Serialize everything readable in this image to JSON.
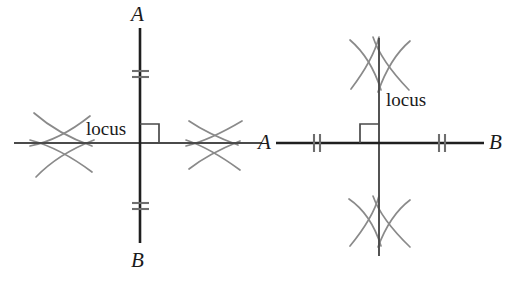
{
  "figure": {
    "kind": "geometry-construction-diagram",
    "stroke_color": "#2b2b2b",
    "arc_color": "#8a8a8a",
    "tick_color": "#6e6e6e",
    "background_color": "#ffffff",
    "panels": [
      {
        "id": "left-panel",
        "name": "vertical-segment-construction",
        "segment_orientation": "vertical",
        "locus_orientation": "horizontal",
        "endpoint_labels": {
          "start": "A",
          "end": "B"
        },
        "locus_label": "locus",
        "tick_marks": {
          "count_per_side": 2,
          "orientation": "horizontal",
          "sides": 2
        },
        "arc_crossings": {
          "count": 2,
          "positions": [
            "left",
            "right"
          ]
        },
        "right_angle_marker": {
          "present": true,
          "quadrant": "upper-right"
        },
        "geometry": {
          "intersection_x": 140,
          "intersection_y": 143,
          "segment_top_y": 28,
          "segment_bottom_y": 243,
          "locus_left_x": 14,
          "locus_right_x": 262,
          "tick_top_y": 74,
          "tick_bottom_y": 206,
          "arc_left_x": 62,
          "arc_right_x": 215
        },
        "label_positions": {
          "start": {
            "x": 131,
            "y": 4
          },
          "end": {
            "x": 131,
            "y": 250
          },
          "locus": {
            "x": 86,
            "y": 119
          }
        }
      },
      {
        "id": "right-panel",
        "name": "horizontal-segment-construction",
        "segment_orientation": "horizontal",
        "locus_orientation": "vertical",
        "endpoint_labels": {
          "start": "A",
          "end": "B"
        },
        "locus_label": "locus",
        "tick_marks": {
          "count_per_side": 2,
          "orientation": "vertical",
          "sides": 2
        },
        "arc_crossings": {
          "count": 2,
          "positions": [
            "top",
            "bottom"
          ]
        },
        "right_angle_marker": {
          "present": true,
          "quadrant": "upper-left"
        },
        "geometry": {
          "intersection_x": 379,
          "intersection_y": 143,
          "segment_left_x": 276,
          "segment_right_x": 484,
          "locus_top_y": 38,
          "locus_bottom_y": 256,
          "tick_left_x": 317,
          "tick_right_x": 442,
          "arc_top_y": 64,
          "arc_bottom_y": 224
        },
        "label_positions": {
          "start": {
            "x": 258,
            "y": 132
          },
          "end": {
            "x": 489,
            "y": 132
          },
          "locus": {
            "x": 386,
            "y": 90
          }
        }
      }
    ]
  }
}
